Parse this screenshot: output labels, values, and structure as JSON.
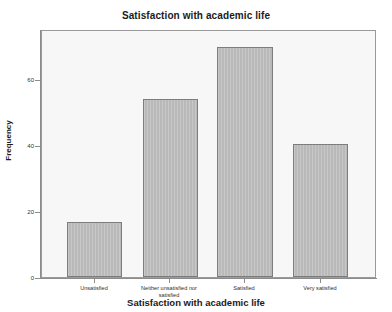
{
  "chart_data": {
    "type": "bar",
    "title": "Satisfaction with academic life",
    "xlabel": "Satisfaction with academic life",
    "ylabel": "Frequency",
    "categories": [
      "Unsatisfied",
      "Neither unsatisfied nor satisfied",
      "Satisfied",
      "Very satisfied"
    ],
    "values": [
      17,
      55,
      71,
      41
    ],
    "ylim": [
      0,
      76
    ],
    "yticks": [
      0,
      20,
      40,
      60
    ],
    "ytick_labels": [
      "0",
      "20",
      "40",
      "60"
    ],
    "grid": false,
    "legend": false,
    "bar_color": "#b9b9b9",
    "bar_edge_color": "#7d7d7d",
    "plot_background": "#f7f7f7",
    "figure_background": "#ffffff",
    "axis_color": "#8c8c8c"
  },
  "tick_labels_wrapped": [
    [
      "Unsatisfied"
    ],
    [
      "Neither unsatisfied nor",
      "satisfied"
    ],
    [
      "Satisfied"
    ],
    [
      "Very satisfied"
    ]
  ]
}
